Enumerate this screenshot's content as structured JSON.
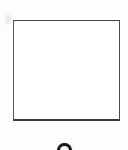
{
  "page": {
    "kind": "scanned-document-crop",
    "width": 128,
    "height": 150,
    "background_color": "#fdfdfd",
    "paper_color": "#ffffff",
    "label": "Scanned page crop containing one empty figure frame"
  },
  "figure": {
    "name": "empty-figure-frame",
    "border_color": "#4a4a4a",
    "border_bottom_color": "#3a3a3a",
    "fill_color": "#ffffff",
    "x": 13,
    "y": 20,
    "width": 107,
    "height": 101,
    "interior_text": ""
  },
  "artifacts": {
    "smudge": {
      "name": "scan-smudge",
      "description": "Faint light-gray scanner smudge in the upper-left margin",
      "color": "#aaaaaa"
    },
    "clipped_caption_glyph": {
      "name": "clipped-caption-glyph",
      "description": "Top sliver of a dark rounded caption character clipped by the bottom edge",
      "color": "#1b1b1b",
      "text": ""
    }
  }
}
